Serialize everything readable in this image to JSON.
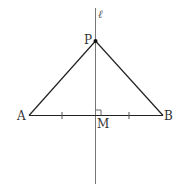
{
  "diagram": {
    "line_label": "ℓ",
    "points": {
      "P": "P",
      "A": "A",
      "B": "B",
      "M": "M"
    },
    "colors": {
      "stroke": "#222222",
      "axis": "#666666",
      "background": "#ffffff"
    }
  }
}
